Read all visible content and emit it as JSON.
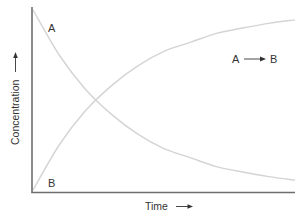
{
  "chart_data": {
    "type": "line",
    "title": "",
    "xlabel": "Time",
    "ylabel": "Concentration",
    "x_axis_arrow": true,
    "y_axis_arrow": true,
    "xlim": [
      0,
      1
    ],
    "ylim": [
      0,
      1
    ],
    "grid": false,
    "ticks": false,
    "annotation": {
      "reactant": "A",
      "product": "B",
      "arrow": "→"
    },
    "series": [
      {
        "name": "A",
        "label_position": "top-left",
        "x": [
          0,
          0.1,
          0.2,
          0.3,
          0.4,
          0.5,
          0.6,
          0.7,
          0.8,
          0.9,
          1.0
        ],
        "values": [
          1.0,
          0.75,
          0.56,
          0.42,
          0.31,
          0.23,
          0.18,
          0.13,
          0.1,
          0.074,
          0.055
        ]
      },
      {
        "name": "B",
        "label_position": "bottom-left",
        "x": [
          0,
          0.1,
          0.2,
          0.3,
          0.4,
          0.5,
          0.6,
          0.7,
          0.8,
          0.9,
          1.0
        ],
        "values": [
          0.0,
          0.25,
          0.44,
          0.58,
          0.69,
          0.77,
          0.82,
          0.87,
          0.9,
          0.926,
          0.945
        ]
      }
    ],
    "colors": {
      "axis": "#6e6e6e",
      "curve": "#d4d4d4",
      "text": "#333333"
    }
  }
}
